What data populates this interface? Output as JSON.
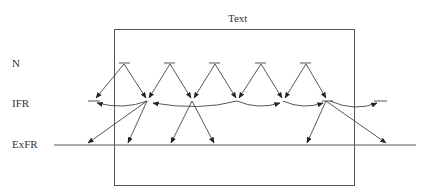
{
  "diagram": {
    "box_title": "Text",
    "row_labels": {
      "n": "N",
      "ifr": "IFR",
      "exfr": "ExFR"
    },
    "colors": {
      "stroke": "#555555",
      "arrow": "#333333",
      "text": "#333333",
      "background": "#ffffff"
    },
    "n_source_count": 5
  }
}
